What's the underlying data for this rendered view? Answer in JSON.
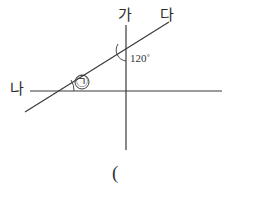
{
  "figure": {
    "type": "geometry-diagram",
    "background_color": "#ffffff",
    "line_color": "#3a3a3a",
    "text_color": "#2b2b2b",
    "labels": {
      "ray_up_label": "가",
      "ray_upper_right_label": "다",
      "ray_left_label": "나",
      "angle_value_label": "120˚",
      "unknown_angle_marker": "㉠",
      "bottom_paren": "("
    },
    "lines": [
      {
        "name": "horizontal-line",
        "x1": 30,
        "y1": 91,
        "x2": 222,
        "y2": 91
      },
      {
        "name": "vertical-line",
        "x1": 126,
        "y1": 25,
        "x2": 126,
        "y2": 150
      },
      {
        "name": "diagonal-line",
        "x1": 25,
        "y1": 112,
        "x2": 169,
        "y2": 22
      }
    ],
    "arcs": [
      {
        "name": "angle-arc-120",
        "vertex_x": 126,
        "vertex_y": 50,
        "measure": "120˚"
      },
      {
        "name": "angle-arc-unknown",
        "vertex_x": 53,
        "vertex_y": 91,
        "measure": "㉠"
      }
    ],
    "circle_marker": {
      "name": "circled-angle-symbol",
      "cx": 82,
      "cy": 82,
      "r": 7
    }
  }
}
